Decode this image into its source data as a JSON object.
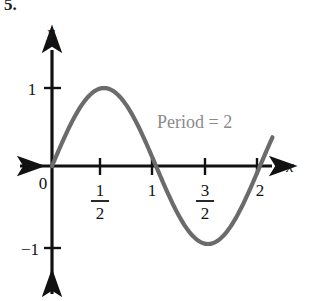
{
  "exercise": {
    "number": "5."
  },
  "figure": {
    "axis_labels": {
      "x": "x",
      "y": "y"
    },
    "origin_label": "0",
    "annotation": "Period = 2",
    "annotation_color": "#8a8a8a",
    "curve_color": "#6b6b6b",
    "axis_color": "#111111",
    "x_tick_labels": [
      {
        "value": 0.5,
        "type": "fraction",
        "numerator": "1",
        "denominator": "2"
      },
      {
        "value": 1,
        "type": "integer",
        "text": "1"
      },
      {
        "value": 1.5,
        "type": "fraction",
        "numerator": "3",
        "denominator": "2"
      },
      {
        "value": 2,
        "type": "integer",
        "text": "2"
      }
    ],
    "y_tick_labels": [
      {
        "value": 1,
        "text": "1"
      },
      {
        "value": -1,
        "text": "−1"
      }
    ]
  },
  "chart_data": {
    "type": "line",
    "title": "",
    "subtitle": "",
    "xlabel": "x",
    "ylabel": "y",
    "xlim": [
      -0.2,
      2.4
    ],
    "ylim": [
      -1.5,
      1.5
    ],
    "grid": false,
    "legend": "none",
    "annotations": [
      {
        "text": "Period = 2",
        "x": 1.3,
        "y": 0.62
      }
    ],
    "xticks": [
      0.5,
      1,
      1.5,
      2
    ],
    "xticklabels": [
      "1/2",
      "1",
      "3/2",
      "2"
    ],
    "yticks": [
      -1,
      1
    ],
    "yticklabels": [
      "−1",
      "1"
    ],
    "series": [
      {
        "name": "y = sin(pi x)",
        "function": "sin(pi*x)",
        "amplitude": 1,
        "period": 2,
        "x": [
          0,
          0.1,
          0.2,
          0.3,
          0.4,
          0.5,
          0.6,
          0.7,
          0.8,
          0.9,
          1.0,
          1.1,
          1.2,
          1.3,
          1.4,
          1.5,
          1.6,
          1.7,
          1.8,
          1.9,
          2.0,
          2.1
        ],
        "y": [
          0,
          0.309,
          0.588,
          0.809,
          0.951,
          1.0,
          0.951,
          0.809,
          0.588,
          0.309,
          0,
          -0.309,
          -0.588,
          -0.809,
          -0.951,
          -1.0,
          -0.951,
          -0.809,
          -0.588,
          -0.309,
          0,
          0.309
        ]
      }
    ]
  }
}
